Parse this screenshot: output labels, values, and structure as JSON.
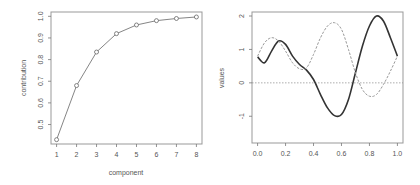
{
  "chart_data": [
    {
      "type": "line",
      "title": "",
      "xlabel": "component",
      "ylabel": "contribution",
      "x": [
        1,
        2,
        3,
        4,
        5,
        6,
        7,
        8
      ],
      "values": [
        0.43,
        0.68,
        0.835,
        0.92,
        0.96,
        0.98,
        0.99,
        0.997
      ],
      "xticks": [
        "1",
        "2",
        "3",
        "4",
        "5",
        "6",
        "7",
        "8"
      ],
      "yticks": [
        "0.5",
        "0.6",
        "0.7",
        "0.8",
        "0.9",
        "1.0"
      ],
      "xlim": [
        0.72,
        8.28
      ],
      "ylim": [
        0.41,
        1.02
      ],
      "markers": "open-circle",
      "grid": false,
      "legend": null
    },
    {
      "type": "line",
      "title": "",
      "xlabel": "",
      "ylabel": "values",
      "x": [
        0.0,
        0.05,
        0.1,
        0.15,
        0.2,
        0.25,
        0.3,
        0.35,
        0.4,
        0.45,
        0.5,
        0.55,
        0.6,
        0.65,
        0.7,
        0.75,
        0.8,
        0.85,
        0.9,
        0.95,
        1.0
      ],
      "series": [
        {
          "name": "solid",
          "style": "solid",
          "values": [
            0.78,
            0.6,
            0.95,
            1.25,
            1.15,
            0.8,
            0.55,
            0.38,
            0.1,
            -0.35,
            -0.75,
            -0.98,
            -0.95,
            -0.5,
            0.3,
            1.1,
            1.7,
            2.0,
            1.85,
            1.35,
            0.8
          ]
        },
        {
          "name": "dashed",
          "style": "dashed",
          "values": [
            0.8,
            1.2,
            1.35,
            1.25,
            0.95,
            0.6,
            0.42,
            0.45,
            0.85,
            1.35,
            1.7,
            1.8,
            1.6,
            1.0,
            0.3,
            -0.2,
            -0.4,
            -0.35,
            -0.05,
            0.35,
            0.8
          ]
        }
      ],
      "reference_line": {
        "y": 0,
        "style": "dotted"
      },
      "xticks": [
        "0.0",
        "0.2",
        "0.4",
        "0.6",
        "0.8",
        "1.0"
      ],
      "yticks": [
        "-1",
        "0",
        "1",
        "2"
      ],
      "xlim": [
        -0.04,
        1.04
      ],
      "ylim": [
        -1.8,
        2.12
      ],
      "grid": false,
      "legend": null
    }
  ],
  "left_chart": {
    "xlabel": "component",
    "ylabel": "contribution",
    "xticks": [
      "1",
      "2",
      "3",
      "4",
      "5",
      "6",
      "7",
      "8"
    ],
    "yticks": [
      "0.5",
      "0.6",
      "0.7",
      "0.8",
      "0.9",
      "1.0"
    ]
  },
  "right_chart": {
    "ylabel": "values",
    "xticks": [
      "0.0",
      "0.2",
      "0.4",
      "0.6",
      "0.8",
      "1.0"
    ],
    "yticks": [
      "-1",
      "0",
      "1",
      "2"
    ]
  },
  "colors": {
    "axis": "#777777",
    "line_left": "#666666",
    "solid": "#333333",
    "dashed": "#999999",
    "text": "#555555"
  }
}
